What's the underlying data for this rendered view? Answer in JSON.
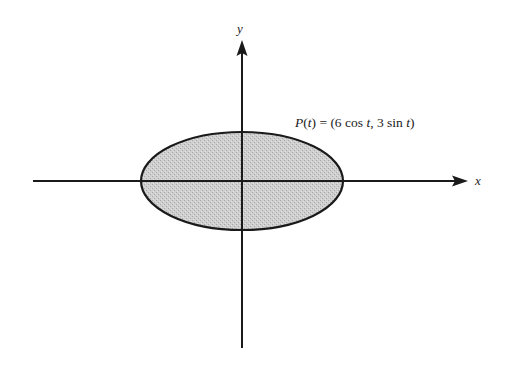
{
  "diagram": {
    "type": "parametric-ellipse",
    "axes": {
      "x_label": "x",
      "y_label": "y"
    },
    "curve": {
      "label_func": "P",
      "label_param": "t",
      "label_eq": " = (6 cos ",
      "label_t1": "t",
      "label_mid": ", 3 sin ",
      "label_t2": "t",
      "label_close": ")",
      "full_label": "P(t) = (6 cos t, 3 sin t)",
      "semi_major": 6,
      "semi_minor": 3
    },
    "colors": {
      "background": "#ffffff",
      "stroke": "#1a1a1a",
      "fill": "#c9c9c9"
    }
  }
}
